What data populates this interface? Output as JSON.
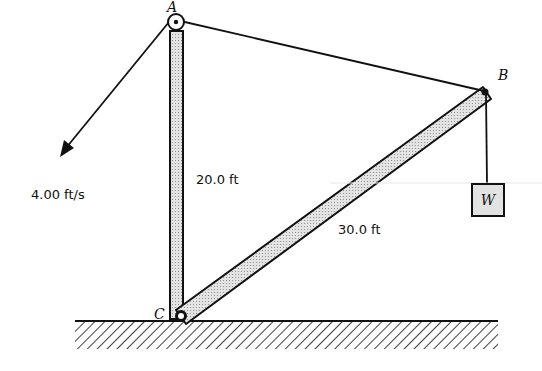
{
  "diagram": {
    "points": {
      "A": {
        "label": "A",
        "x": 176,
        "y": 22
      },
      "B": {
        "label": "B",
        "x": 484,
        "y": 92
      },
      "C": {
        "label": "C",
        "x": 181,
        "y": 316
      }
    },
    "labels": {
      "pulley_A": "A",
      "end_B": "B",
      "pivot_C": "C",
      "weight": "W",
      "vertical_post_length": "20.0 ft",
      "boom_length": "30.0 ft",
      "rope_speed": "4.00 ft/s"
    },
    "colors": {
      "line": "#111111",
      "member_fill": "#d9d9d9",
      "weight_fill": "#e0e0e0",
      "background": "#ffffff"
    }
  }
}
